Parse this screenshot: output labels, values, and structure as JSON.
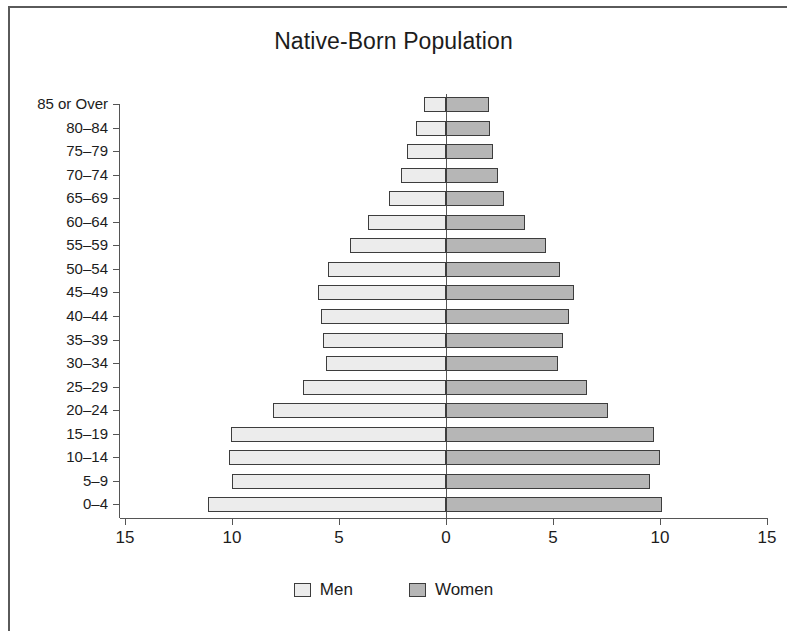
{
  "chart_data": {
    "type": "bar",
    "subtype": "population-pyramid",
    "title": "Native-Born Population",
    "xlabel": "",
    "ylabel": "",
    "categories": [
      "85 or Over",
      "80–84",
      "75–79",
      "70–74",
      "65–69",
      "60–64",
      "55–59",
      "50–54",
      "45–49",
      "40–44",
      "35–39",
      "30–34",
      "25–29",
      "20–24",
      "15–19",
      "10–14",
      "5–9",
      "0–4"
    ],
    "series": [
      {
        "name": "Men",
        "side": "left",
        "color": "#ececec",
        "values": [
          1.05,
          1.4,
          1.8,
          2.1,
          2.65,
          3.65,
          4.5,
          5.5,
          6.0,
          5.85,
          5.75,
          5.6,
          6.7,
          8.1,
          10.05,
          10.15,
          10.0,
          11.1
        ]
      },
      {
        "name": "Women",
        "side": "right",
        "color": "#b6b6b6",
        "values": [
          2.0,
          2.05,
          2.2,
          2.45,
          2.7,
          3.7,
          4.65,
          5.35,
          6.0,
          5.75,
          5.45,
          5.25,
          6.6,
          7.55,
          9.7,
          10.0,
          9.55,
          10.1
        ]
      }
    ],
    "xticks": [
      {
        "label": "15",
        "value": -15
      },
      {
        "label": "10",
        "value": -10
      },
      {
        "label": "5",
        "value": -5
      },
      {
        "label": "0",
        "value": 0
      },
      {
        "label": "5",
        "value": 5
      },
      {
        "label": "10",
        "value": 10
      },
      {
        "label": "15",
        "value": 15
      }
    ],
    "xlim": [
      -15,
      15
    ],
    "grid": false,
    "legend_position": "bottom"
  },
  "legend": {
    "men_label": "Men",
    "women_label": "Women"
  }
}
